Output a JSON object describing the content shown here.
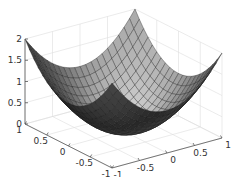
{
  "chart_data": {
    "type": "surface",
    "title": "",
    "function": "z = x^2 + y^2",
    "xlabel": "",
    "ylabel": "",
    "zlabel": "",
    "xlim": [
      -1,
      1
    ],
    "ylim": [
      -1,
      1
    ],
    "zlim": [
      0,
      2
    ],
    "grid": true,
    "colormap": "gray",
    "mesh_resolution": 20,
    "x_ticks": [
      "-1",
      "-0.5",
      "0",
      "0.5",
      "1"
    ],
    "y_ticks": [
      "1",
      "0.5",
      "0",
      "-0.5",
      "-1"
    ],
    "z_ticks": [
      "0",
      "0.5",
      "1",
      "1.5",
      "2"
    ],
    "x_tick_values": [
      -1,
      -0.5,
      0,
      0.5,
      1
    ],
    "y_tick_values": [
      1,
      0.5,
      0,
      -0.5,
      -1
    ],
    "z_tick_values": [
      0,
      0.5,
      1,
      1.5,
      2
    ],
    "colors": {
      "background": "#ffffff",
      "grid": "#dddddd",
      "axis": "#555555",
      "mesh_edge": "#1a1a1a"
    }
  }
}
